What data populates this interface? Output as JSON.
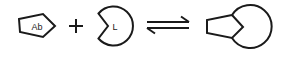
{
  "diagram": {
    "type": "reaction-equation",
    "reactants": [
      {
        "id": "antibody",
        "shape": "pentagon",
        "label": "Ab"
      },
      {
        "id": "ligand",
        "shape": "notched-circle",
        "label": "L"
      }
    ],
    "operator": "+",
    "relation": "reversible-equilibrium",
    "product": {
      "id": "complex",
      "shape": "pentagon-bound-to-notched-circle",
      "label": ""
    },
    "colors": {
      "stroke": "#1a1a1a",
      "background": "#ffffff"
    }
  }
}
